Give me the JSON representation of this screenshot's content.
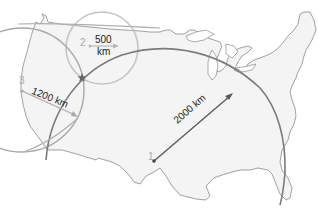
{
  "diagram": {
    "type": "trilateration-map",
    "region": "contiguous-united-states",
    "colors": {
      "land_fill": "#f4f4f4",
      "land_outline": "#8a8a8a",
      "circle_1": "#7a7a7a",
      "circle_2": "#c4c4c4",
      "circle_3": "#a0a0a0",
      "arrow_1": "#6a6a6a",
      "arrow_2": "#b8b8b8",
      "arrow_3": "#a8a8a8",
      "station_number": "#a8a8a8",
      "distance_text": "#222222"
    },
    "stations": [
      {
        "number": "1",
        "distance": "2000 km"
      },
      {
        "number": "2",
        "distance_line1": "500",
        "distance_line2": "km"
      },
      {
        "number": "3",
        "distance": "1200 km"
      }
    ],
    "intersection_marker": "star"
  }
}
